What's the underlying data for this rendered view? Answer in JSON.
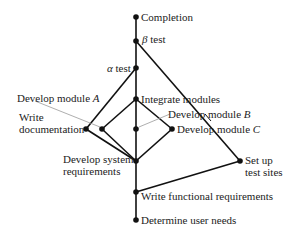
{
  "diagram": {
    "type": "hasse-diagram",
    "colors": {
      "line": "#111111",
      "leader": "#999999",
      "node": "#111111",
      "text": "#222222"
    },
    "nodes": [
      {
        "id": "completion",
        "label": "Completion",
        "x": 136,
        "y": 17
      },
      {
        "id": "beta_test",
        "label": "β test",
        "x": 136,
        "y": 41
      },
      {
        "id": "alpha_test",
        "label": "α test",
        "x": 136,
        "y": 68
      },
      {
        "id": "integrate_modules",
        "label": "Integrate modules",
        "x": 136,
        "y": 99
      },
      {
        "id": "write_documentation",
        "label": "Write documentation",
        "x": 86,
        "y": 129
      },
      {
        "id": "develop_module_a",
        "label": "Develop module A",
        "x": 102,
        "y": 129
      },
      {
        "id": "develop_module_b",
        "label": "Develop module B",
        "x": 136,
        "y": 129
      },
      {
        "id": "develop_module_c",
        "label": "Develop module C",
        "x": 172,
        "y": 129
      },
      {
        "id": "develop_system_requirements",
        "label": "Develop system requirements",
        "x": 136,
        "y": 161
      },
      {
        "id": "set_up_test_sites",
        "label": "Set up test sites",
        "x": 240,
        "y": 161
      },
      {
        "id": "write_functional_requirements",
        "label": "Write functional requirements",
        "x": 136,
        "y": 192
      },
      {
        "id": "determine_user_needs",
        "label": "Determine user needs",
        "x": 136,
        "y": 220
      }
    ],
    "edges": [
      [
        "determine_user_needs",
        "write_functional_requirements"
      ],
      [
        "write_functional_requirements",
        "develop_system_requirements"
      ],
      [
        "write_functional_requirements",
        "set_up_test_sites"
      ],
      [
        "develop_system_requirements",
        "write_documentation"
      ],
      [
        "develop_system_requirements",
        "develop_module_a"
      ],
      [
        "develop_system_requirements",
        "develop_module_b"
      ],
      [
        "develop_system_requirements",
        "develop_module_c"
      ],
      [
        "develop_module_a",
        "integrate_modules"
      ],
      [
        "develop_module_b",
        "integrate_modules"
      ],
      [
        "develop_module_c",
        "integrate_modules"
      ],
      [
        "integrate_modules",
        "alpha_test"
      ],
      [
        "write_documentation",
        "alpha_test"
      ],
      [
        "alpha_test",
        "beta_test"
      ],
      [
        "set_up_test_sites",
        "beta_test"
      ],
      [
        "beta_test",
        "completion"
      ]
    ],
    "labels": {
      "completion": "Completion",
      "beta_symbol": "β",
      "beta_text": " test",
      "alpha_symbol": "α",
      "alpha_text": " test",
      "integrate_modules": "Integrate modules",
      "develop_module_a_text": "Develop module ",
      "develop_module_a_letter": "A",
      "develop_module_b_text": "Develop module ",
      "develop_module_b_letter": "B",
      "develop_module_c_text": "Develop module ",
      "develop_module_c_letter": "C",
      "write_documentation_line1": "Write",
      "write_documentation_line2": "documentation",
      "develop_system_requirements_line1": "Develop system",
      "develop_system_requirements_line2": "requirements",
      "set_up_test_sites_line1": "Set up",
      "set_up_test_sites_line2": "test sites",
      "write_functional_requirements": "Write functional requirements",
      "determine_user_needs": "Determine user needs"
    }
  }
}
